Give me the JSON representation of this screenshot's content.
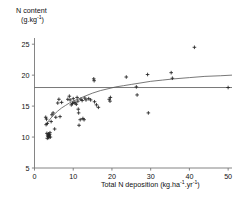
{
  "chart_data": {
    "type": "scatter",
    "title": "",
    "ylabel_line1": "N content",
    "ylabel_line2_prefix": "(g.kg",
    "ylabel_line2_sup": "-1",
    "ylabel_line2_suffix": ")",
    "xlabel_prefix": "Total N deposition (kg.ha",
    "xlabel_sup1": "-1",
    "xlabel_mid": ".yr",
    "xlabel_sup2": "-1",
    "xlabel_suffix": ")",
    "xlabel_plain": "Total N deposition (kg.ha-1.yr-1)",
    "ylabel_plain": "N content (g.kg-1)",
    "xlim": [
      0,
      51
    ],
    "ylim": [
      5,
      26
    ],
    "xticks": [
      0,
      10,
      20,
      30,
      40,
      50
    ],
    "yticks": [
      5,
      10,
      15,
      20,
      25
    ],
    "grid": false,
    "legend": "none",
    "marker": "plus",
    "marker_color": "#222222",
    "curve_color": "#555555",
    "reference_line_color": "#555555",
    "axis_color": "#777777",
    "reference_line": {
      "orientation": "horizontal",
      "y": 18,
      "x_start": 0,
      "x_end": 51
    },
    "fit_curve": {
      "description": "saturating logarithmic fit",
      "points": [
        [
          3.0,
          12.0
        ],
        [
          4.0,
          12.9
        ],
        [
          5.0,
          13.6
        ],
        [
          6.0,
          14.2
        ],
        [
          7.0,
          14.7
        ],
        [
          8.0,
          15.1
        ],
        [
          9.0,
          15.5
        ],
        [
          10.0,
          15.8
        ],
        [
          11.5,
          16.2
        ],
        [
          13.0,
          16.6
        ],
        [
          15.0,
          17.1
        ],
        [
          17.0,
          17.5
        ],
        [
          19.0,
          17.8
        ],
        [
          21.0,
          18.1
        ],
        [
          23.0,
          18.3
        ],
        [
          25.0,
          18.5
        ],
        [
          27.0,
          18.7
        ],
        [
          30.0,
          19.0
        ],
        [
          33.0,
          19.2
        ],
        [
          36.0,
          19.4
        ],
        [
          40.0,
          19.6
        ],
        [
          44.0,
          19.8
        ],
        [
          48.0,
          19.9
        ],
        [
          51.0,
          20.0
        ]
      ]
    },
    "points": [
      [
        2.9,
        13.2
      ],
      [
        3.1,
        12.9
      ],
      [
        3.0,
        12.0
      ],
      [
        3.3,
        12.2
      ],
      [
        3.2,
        10.6
      ],
      [
        3.4,
        10.3
      ],
      [
        3.5,
        10.1
      ],
      [
        3.3,
        9.8
      ],
      [
        3.6,
        10.5
      ],
      [
        3.8,
        10.2
      ],
      [
        3.7,
        9.9
      ],
      [
        3.9,
        10.4
      ],
      [
        4.0,
        10.7
      ],
      [
        4.1,
        10.0
      ],
      [
        4.3,
        12.5
      ],
      [
        4.5,
        13.6
      ],
      [
        4.8,
        13.9
      ],
      [
        5.2,
        11.3
      ],
      [
        5.5,
        13.2
      ],
      [
        6.0,
        15.5
      ],
      [
        6.3,
        16.1
      ],
      [
        6.6,
        13.3
      ],
      [
        7.0,
        15.6
      ],
      [
        8.6,
        16.1
      ],
      [
        9.0,
        16.6
      ],
      [
        9.2,
        16.0
      ],
      [
        9.5,
        15.2
      ],
      [
        9.8,
        15.4
      ],
      [
        10.0,
        16.2
      ],
      [
        10.2,
        15.6
      ],
      [
        10.5,
        15.5
      ],
      [
        10.8,
        15.3
      ],
      [
        11.0,
        16.4
      ],
      [
        11.2,
        15.8
      ],
      [
        11.3,
        14.5
      ],
      [
        11.4,
        13.9
      ],
      [
        11.5,
        11.9
      ],
      [
        11.8,
        12.8
      ],
      [
        12.0,
        16.1
      ],
      [
        12.3,
        15.9
      ],
      [
        12.5,
        13.0
      ],
      [
        12.8,
        12.8
      ],
      [
        13.0,
        16.3
      ],
      [
        13.3,
        16.0
      ],
      [
        14.0,
        16.2
      ],
      [
        14.5,
        16.0
      ],
      [
        15.3,
        19.4
      ],
      [
        15.4,
        19.1
      ],
      [
        15.5,
        15.7
      ],
      [
        16.0,
        15.2
      ],
      [
        16.5,
        14.8
      ],
      [
        19.3,
        16.1
      ],
      [
        19.5,
        15.8
      ],
      [
        19.6,
        16.4
      ],
      [
        23.7,
        19.7
      ],
      [
        26.3,
        18.1
      ],
      [
        26.5,
        16.8
      ],
      [
        29.2,
        20.1
      ],
      [
        29.4,
        13.9
      ],
      [
        35.3,
        20.4
      ],
      [
        35.6,
        19.5
      ],
      [
        41.3,
        24.5
      ],
      [
        50.0,
        18.0
      ]
    ]
  }
}
